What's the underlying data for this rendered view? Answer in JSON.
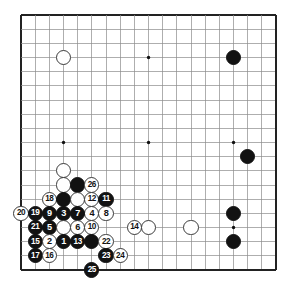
{
  "diagram": {
    "kind": "go-board-diagram",
    "board_size": 19,
    "title": "",
    "colors": {
      "background": "#ffffff",
      "grid_line": "#8c8c8c",
      "border_line": "#222222",
      "black_stone": "#121212",
      "white_stone": "#ffffff",
      "white_stone_edge": "#3a3a3a",
      "star_point": "#111111",
      "black_label_text": "#ffffff",
      "white_label_text": "#121212"
    },
    "geometry": {
      "origin_x": 21,
      "origin_y": 15,
      "spacing": 14.17,
      "stone_radius": 7.6,
      "star_radius": 1.7
    },
    "star_points": [
      {
        "col": 4,
        "row": 4
      },
      {
        "col": 10,
        "row": 4
      },
      {
        "col": 16,
        "row": 4
      },
      {
        "col": 4,
        "row": 10
      },
      {
        "col": 10,
        "row": 10
      },
      {
        "col": 16,
        "row": 10
      },
      {
        "col": 4,
        "row": 16
      },
      {
        "col": 10,
        "row": 16
      },
      {
        "col": 16,
        "row": 16
      }
    ],
    "stones": [
      {
        "col": 4,
        "row": 4,
        "color": "white",
        "label": ""
      },
      {
        "col": 16,
        "row": 4,
        "color": "black",
        "label": ""
      },
      {
        "col": 17,
        "row": 11,
        "color": "black",
        "label": ""
      },
      {
        "col": 16,
        "row": 15,
        "color": "black",
        "label": ""
      },
      {
        "col": 16,
        "row": 17,
        "color": "black",
        "label": ""
      },
      {
        "col": 10,
        "row": 16,
        "color": "white",
        "label": ""
      },
      {
        "col": 13,
        "row": 16,
        "color": "white",
        "label": ""
      },
      {
        "col": 4,
        "row": 12,
        "color": "white",
        "label": ""
      },
      {
        "col": 4,
        "row": 13,
        "color": "white",
        "label": ""
      },
      {
        "col": 5,
        "row": 13,
        "color": "black",
        "label": ""
      },
      {
        "col": 6,
        "row": 13,
        "color": "white",
        "label": "26"
      },
      {
        "col": 6,
        "row": 14,
        "color": "white",
        "label": "12"
      },
      {
        "col": 3,
        "row": 14,
        "color": "white",
        "label": "18"
      },
      {
        "col": 4,
        "row": 14,
        "color": "black",
        "label": ""
      },
      {
        "col": 5,
        "row": 14,
        "color": "white",
        "label": ""
      },
      {
        "col": 6,
        "row": 15,
        "color": "white",
        "label": "4"
      },
      {
        "col": 7,
        "row": 14,
        "color": "black",
        "label": "11"
      },
      {
        "col": 1,
        "row": 15,
        "color": "white",
        "label": "20"
      },
      {
        "col": 2,
        "row": 15,
        "color": "black",
        "label": "19"
      },
      {
        "col": 3,
        "row": 15,
        "color": "black",
        "label": "9"
      },
      {
        "col": 4,
        "row": 15,
        "color": "black",
        "label": "3"
      },
      {
        "col": 5,
        "row": 15,
        "color": "black",
        "label": "7"
      },
      {
        "col": 7,
        "row": 15,
        "color": "white",
        "label": "8"
      },
      {
        "col": 2,
        "row": 16,
        "color": "black",
        "label": "21"
      },
      {
        "col": 3,
        "row": 16,
        "color": "black",
        "label": "5"
      },
      {
        "col": 4,
        "row": 16,
        "color": "white",
        "label": ""
      },
      {
        "col": 5,
        "row": 16,
        "color": "white",
        "label": "6"
      },
      {
        "col": 6,
        "row": 16,
        "color": "white",
        "label": "10"
      },
      {
        "col": 9,
        "row": 16,
        "color": "white",
        "label": "14"
      },
      {
        "col": 2,
        "row": 17,
        "color": "black",
        "label": "15"
      },
      {
        "col": 3,
        "row": 17,
        "color": "white",
        "label": "2"
      },
      {
        "col": 4,
        "row": 17,
        "color": "black",
        "label": "1"
      },
      {
        "col": 5,
        "row": 17,
        "color": "black",
        "label": "13"
      },
      {
        "col": 6,
        "row": 17,
        "color": "black",
        "label": ""
      },
      {
        "col": 7,
        "row": 17,
        "color": "white",
        "label": "22"
      },
      {
        "col": 2,
        "row": 18,
        "color": "black",
        "label": "17"
      },
      {
        "col": 3,
        "row": 18,
        "color": "white",
        "label": "16"
      },
      {
        "col": 7,
        "row": 18,
        "color": "black",
        "label": "23"
      },
      {
        "col": 8,
        "row": 18,
        "color": "white",
        "label": "24"
      },
      {
        "col": 6,
        "row": 19,
        "color": "black",
        "label": "25"
      }
    ]
  }
}
